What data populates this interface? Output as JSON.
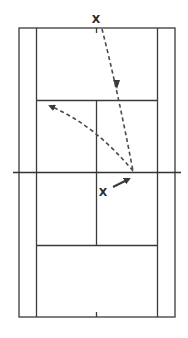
{
  "diagram": {
    "title": "",
    "type": "tennis-court-drill",
    "colors": {
      "background": "#ffffff",
      "lines": "#3a3a3a",
      "shot_path": "#4a4a4a"
    },
    "players": [
      {
        "id": "server",
        "label": "X",
        "position": "behind far baseline, center"
      },
      {
        "id": "receiver",
        "label": "X",
        "position": "near side of net, right of center"
      }
    ],
    "shots": [
      {
        "id": "serve",
        "style": "dashed",
        "from": "far baseline center",
        "to": "bounce near net, right service box",
        "arrow": "mid-path, pointing down"
      },
      {
        "id": "return",
        "style": "dashed-curved",
        "from": "bounce point near net",
        "to": "far left service box corner",
        "arrow": "at end"
      },
      {
        "id": "player-move",
        "style": "solid",
        "from": "receiver X",
        "to": "bounce point",
        "arrow": "at end"
      }
    ]
  }
}
